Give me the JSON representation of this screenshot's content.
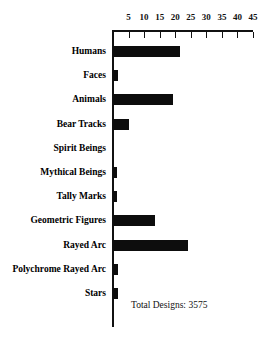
{
  "chart_data": {
    "type": "bar",
    "orientation": "horizontal",
    "title": "",
    "xlabel": "",
    "ylabel": "",
    "xlim": [
      0,
      45
    ],
    "grid": false,
    "legend": null,
    "tick_labels": [
      "5",
      "10",
      "15",
      "20",
      "25",
      "30",
      "35",
      "40",
      "45"
    ],
    "ticks": [
      5,
      10,
      15,
      20,
      25,
      30,
      35,
      40,
      45
    ],
    "categories": [
      "Humans",
      "Faces",
      "Animals",
      "Bear Tracks",
      "Spirit Beings",
      "Mythical Beings",
      "Tally Marks",
      "Geometric Figures",
      "Rayed Arc",
      "Polychrome Rayed Arc",
      "Stars"
    ],
    "values": [
      21.5,
      1.5,
      19.2,
      5.2,
      0,
      1.2,
      1.2,
      13.5,
      24,
      1.5,
      1.5
    ],
    "annotations": [
      {
        "text": "Total Designs: 3575",
        "x": 11,
        "y": "Stars"
      }
    ],
    "bar_color": "#0d0d0d",
    "axis_color": "#111111"
  },
  "annotation": {
    "total_designs_label": "Total Designs: 3575"
  }
}
